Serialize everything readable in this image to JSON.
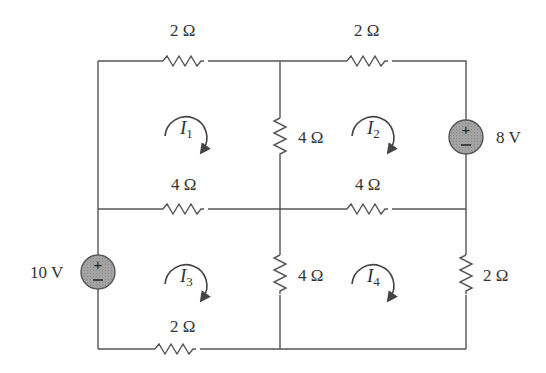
{
  "diagram": {
    "type": "circuit",
    "colors": {
      "wire": "#555555",
      "source_fill": "#9a9a9a",
      "text": "#333333"
    },
    "resistors": [
      {
        "id": "R_top_left",
        "label": "2 Ω",
        "value_ohm": 2
      },
      {
        "id": "R_top_right",
        "label": "2 Ω",
        "value_ohm": 2
      },
      {
        "id": "R_mid_left",
        "label": "4 Ω",
        "value_ohm": 4
      },
      {
        "id": "R_mid_right",
        "label": "4 Ω",
        "value_ohm": 4
      },
      {
        "id": "R_center_upper",
        "label": "4 Ω",
        "value_ohm": 4
      },
      {
        "id": "R_center_lower",
        "label": "4 Ω",
        "value_ohm": 4
      },
      {
        "id": "R_bottom_left",
        "label": "2 Ω",
        "value_ohm": 2
      },
      {
        "id": "R_right_lower",
        "label": "2 Ω",
        "value_ohm": 2
      }
    ],
    "sources": [
      {
        "id": "V1",
        "label": "8 V",
        "value_v": 8,
        "plus": "+",
        "minus": "−"
      },
      {
        "id": "V2",
        "label": "10 V",
        "value_v": 10,
        "plus": "+",
        "minus": "−"
      }
    ],
    "mesh_currents": [
      {
        "id": "I1",
        "symbol": "I",
        "sub": "1",
        "direction": "clockwise"
      },
      {
        "id": "I2",
        "symbol": "I",
        "sub": "2",
        "direction": "clockwise"
      },
      {
        "id": "I3",
        "symbol": "I",
        "sub": "3",
        "direction": "clockwise"
      },
      {
        "id": "I4",
        "symbol": "I",
        "sub": "4",
        "direction": "clockwise"
      }
    ]
  }
}
